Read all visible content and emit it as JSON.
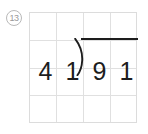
{
  "problem": {
    "number_label": "13",
    "number_style": "circled",
    "type": "long-division",
    "divisor": "41",
    "dividend": "91",
    "expression": "41)91",
    "divisor_digits": [
      "4",
      "1"
    ],
    "dividend_digits": [
      "9",
      "1"
    ],
    "quotient": "",
    "bracket_glyph": ")"
  },
  "grid": {
    "columns": 4,
    "rows": 4,
    "line_color": "#e0e0e0",
    "border_color": "#dcdcdc",
    "background": "#ffffff",
    "cells": [
      [
        "",
        "",
        "",
        ""
      ],
      [
        "4",
        "1",
        "9",
        "1"
      ],
      [
        "",
        "",
        "",
        ""
      ],
      [
        "",
        "",
        "",
        ""
      ]
    ]
  },
  "colors": {
    "ink": "#1d1d1d",
    "label": "#9a9a9a",
    "label_border": "#b9b9b9",
    "page_background": "#ffffff"
  }
}
